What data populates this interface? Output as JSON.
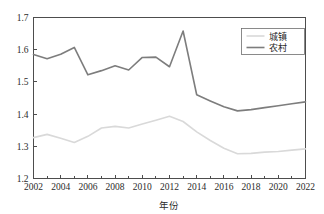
{
  "chart_data": {
    "type": "line",
    "title": "",
    "xlabel": "年份",
    "ylabel": "",
    "xlim": [
      2002,
      2022
    ],
    "ylim": [
      1.2,
      1.7
    ],
    "grid": false,
    "legend_position": "top-right",
    "x": [
      2002,
      2003,
      2004,
      2005,
      2006,
      2007,
      2008,
      2009,
      2010,
      2011,
      2012,
      2013,
      2014,
      2015,
      2016,
      2017,
      2018,
      2019,
      2020,
      2021,
      2022
    ],
    "x_tick_labels": [
      "2002",
      "2004",
      "2006",
      "2008",
      "2010",
      "2012",
      "2014",
      "2016",
      "2018",
      "2020",
      "2022"
    ],
    "x_tick_values": [
      2002,
      2004,
      2006,
      2008,
      2010,
      2012,
      2014,
      2016,
      2018,
      2020,
      2022
    ],
    "x_minor_tick_values": [
      2003,
      2005,
      2007,
      2009,
      2011,
      2013,
      2015,
      2017,
      2019,
      2021
    ],
    "y_tick_labels": [
      "1.2",
      "1.3",
      "1.4",
      "1.5",
      "1.6",
      "1.7"
    ],
    "y_tick_values": [
      1.2,
      1.3,
      1.4,
      1.5,
      1.6,
      1.7
    ],
    "series": [
      {
        "name": "城镇",
        "color": "#d9d9d9",
        "line_width": 1.6,
        "values": [
          1.327,
          1.337,
          1.325,
          1.312,
          1.331,
          1.357,
          1.362,
          1.357,
          1.369,
          1.381,
          1.393,
          1.377,
          1.345,
          1.318,
          1.294,
          1.277,
          1.278,
          1.282,
          1.284,
          1.288,
          1.292
        ]
      },
      {
        "name": "农村",
        "color": "#7d7d7d",
        "line_width": 1.6,
        "values": [
          1.585,
          1.572,
          1.586,
          1.607,
          1.522,
          1.535,
          1.55,
          1.537,
          1.576,
          1.577,
          1.547,
          1.658,
          1.46,
          1.441,
          1.423,
          1.41,
          1.414,
          1.42,
          1.426,
          1.432,
          1.438
        ]
      }
    ]
  },
  "legend": {
    "entries": [
      {
        "label": "城镇"
      },
      {
        "label": "农村"
      }
    ]
  }
}
